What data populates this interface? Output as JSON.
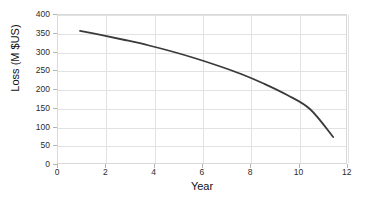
{
  "chart_data": {
    "type": "line",
    "title": "",
    "subtitle": "",
    "xlabel": "Year",
    "ylabel": "Loss (M $US)",
    "xlim": [
      0,
      12.6
    ],
    "ylim": [
      0,
      400
    ],
    "grid": true,
    "legend": null,
    "legend_position": "none",
    "xticks": [
      0,
      2,
      4,
      6,
      8,
      10,
      12
    ],
    "xtick_labels": [
      "0",
      "2",
      "4",
      "6",
      "8",
      "10",
      "12"
    ],
    "yticks": [
      0,
      50,
      100,
      150,
      200,
      250,
      300,
      350,
      400
    ],
    "ytick_labels": [
      "0",
      "50",
      "100",
      "150",
      "200",
      "250",
      "300",
      "350",
      "400"
    ],
    "line_color": "#3a3a3a",
    "line_width": 1.8,
    "series": [
      {
        "name": "Loss",
        "x": [
          1,
          2,
          3,
          4,
          5,
          6,
          7,
          8,
          9,
          10,
          11,
          12
        ],
        "values": [
          355,
          343,
          330,
          316,
          300,
          282,
          262,
          240,
          214,
          184,
          146,
          72
        ]
      }
    ]
  },
  "axis": {
    "x_title": "Year",
    "y_title": "Loss (M $US)"
  }
}
